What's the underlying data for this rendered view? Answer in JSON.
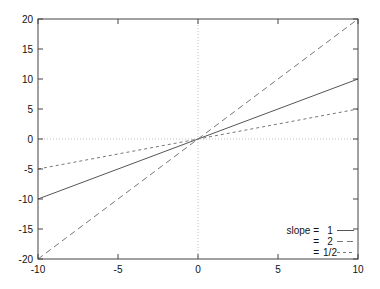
{
  "chart_data": {
    "type": "line",
    "title": "",
    "xlabel": "",
    "ylabel": "",
    "xlim": [
      -10,
      10
    ],
    "ylim": [
      -20,
      20
    ],
    "x_ticks": [
      -10,
      -5,
      0,
      5,
      10
    ],
    "y_ticks": [
      -20,
      -15,
      -10,
      -5,
      0,
      5,
      10,
      15,
      20
    ],
    "grid": false,
    "zero_axes": true,
    "legend_position": "lower right",
    "legend_title": "slope =",
    "series": [
      {
        "name": "1",
        "label": "slope =   1",
        "slope": 1,
        "style": "solid",
        "x": [
          -10,
          10
        ],
        "y": [
          -10,
          10
        ]
      },
      {
        "name": "2",
        "label": "=   2",
        "slope": 2,
        "style": "dashed",
        "x": [
          -10,
          10
        ],
        "y": [
          -20,
          20
        ]
      },
      {
        "name": "1/2",
        "label": "= 1/2",
        "slope": 0.5,
        "style": "short-dashed",
        "x": [
          -10,
          10
        ],
        "y": [
          -5,
          5
        ]
      }
    ]
  },
  "legend": {
    "rows": [
      {
        "prefix": "slope =",
        "value": "1"
      },
      {
        "prefix": "=",
        "value": "2"
      },
      {
        "prefix": "=",
        "value": "1/2"
      }
    ]
  }
}
